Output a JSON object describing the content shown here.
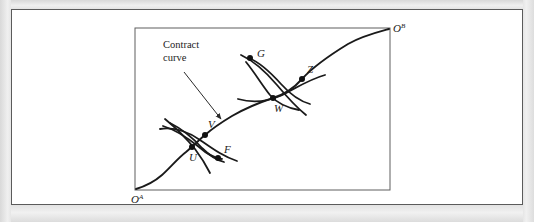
{
  "figure": {
    "domain": "diagram",
    "background_color": "#e9e9e9",
    "panel_color": "#ffffff",
    "frame_border_color": "#5b5b5b",
    "ink_color": "#1a1a1a"
  },
  "annotation": {
    "line1": "Contract",
    "line2": "curve",
    "arrow_from": [
      184,
      72
    ],
    "arrow_to": [
      221,
      119
    ]
  },
  "origins": {
    "a": {
      "letter": "O",
      "superscript": "A",
      "x": 131,
      "y": 199
    },
    "b": {
      "letter": "O",
      "superscript": "B",
      "x": 392,
      "y": 31
    }
  },
  "box": {
    "x": 135,
    "y": 28,
    "width": 255,
    "height": 162
  },
  "points": [
    {
      "id": "G",
      "label": "G",
      "x": 250,
      "y": 58,
      "label_dx": 7,
      "label_dy": -1
    },
    {
      "id": "Z",
      "label": "Z",
      "x": 302,
      "y": 79,
      "label_dx": 5,
      "label_dy": -6
    },
    {
      "id": "W",
      "label": "W",
      "x": 273,
      "y": 98,
      "label_dx": 1,
      "label_dy": 14
    },
    {
      "id": "V",
      "label": "V",
      "x": 205,
      "y": 135,
      "label_dx": 3,
      "label_dy": -7
    },
    {
      "id": "U",
      "label": "U",
      "x": 192,
      "y": 147,
      "label_dx": -3,
      "label_dy": 14
    },
    {
      "id": "F",
      "label": "F",
      "x": 218,
      "y": 158,
      "label_dx": 6,
      "label_dy": -5
    }
  ],
  "curves": {
    "contract_curve_path": "M 136,189 C 146,186 154,182 162,175 C 170,168 178,158 186,152 C 192,147 198,141 205,135 C 213,128 222,122 232,116 C 244,109 258,103 273,98 C 286,94 295,87 302,79 C 312,68 330,55 348,44 C 362,36 378,32 389,29",
    "indifference_curves": [
      {
        "name": "curve-A-lower",
        "path": "M 165,119 C 176,128 186,138 195,149 C 201,157 206,165 210,173"
      },
      {
        "name": "curve-B-lower",
        "path": "M 160,129 C 173,127 187,131 200,140 C 213,149 224,157 237,161"
      },
      {
        "name": "curve-lens-lower-upper",
        "path": "M 170,123 C 182,129 193,138 202,148 C 210,156 216,160 224,162"
      },
      {
        "name": "curve-lens-lower-lower",
        "path": "M 163,126 C 176,130 188,138 199,147 C 208,155 214,158 222,159"
      },
      {
        "name": "curve-A-upper",
        "path": "M 241,55 C 254,61 266,72 277,85 C 287,97 296,107 306,115"
      },
      {
        "name": "curve-B-upper",
        "path": "M 238,99 C 252,103 266,102 280,96 C 296,88 310,79 325,75"
      },
      {
        "name": "curve-lens-upper-upper",
        "path": "M 249,58 C 261,63 272,74 281,84 C 290,94 299,101 310,104"
      },
      {
        "name": "curve-lens-upper-lower",
        "path": "M 246,62 C 255,73 262,85 270,95 C 277,103 288,108 299,110"
      }
    ]
  }
}
